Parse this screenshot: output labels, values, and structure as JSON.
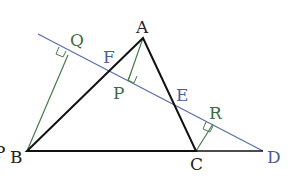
{
  "colors": {
    "triangle": "#111111",
    "secant": "#5a6fa8",
    "perpendicular": "#4a7a4a",
    "label_black": "#222222",
    "label_blue": "#4a5f98",
    "label_green": "#3f6b3f"
  },
  "points": {
    "A": {
      "label": "A",
      "x": 143,
      "y": 38
    },
    "B": {
      "label": "B",
      "x": 27,
      "y": 151
    },
    "C": {
      "label": "C",
      "x": 196,
      "y": 151
    },
    "D": {
      "label": "D",
      "x": 263,
      "y": 151
    },
    "E": {
      "label": "E",
      "x": 174,
      "y": 104
    },
    "F": {
      "label": "F",
      "x": 108,
      "y": 72
    },
    "P": {
      "label": "P",
      "x": 128,
      "y": 81
    },
    "Q": {
      "label": "Q",
      "x": 68,
      "y": 50
    },
    "R": {
      "label": "R",
      "x": 215,
      "y": 127
    }
  },
  "labels": {
    "A": "A",
    "B": "B",
    "C": "C",
    "D": "D",
    "E": "E",
    "F": "F",
    "P": "P",
    "Q": "Q",
    "R": "R",
    "partial": "P"
  }
}
